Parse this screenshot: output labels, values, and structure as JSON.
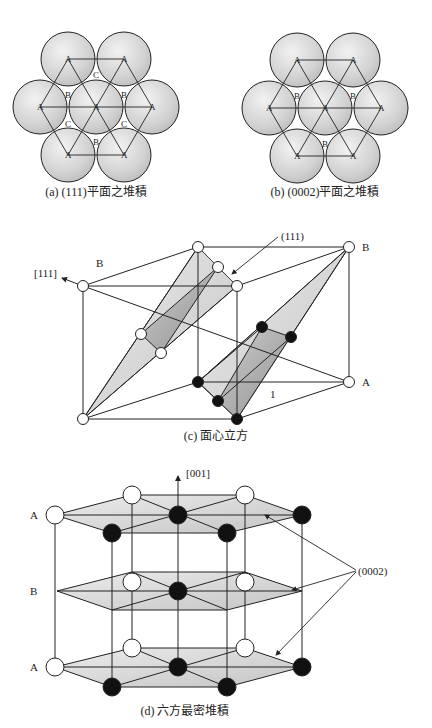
{
  "panels": {
    "a": {
      "caption": "(a) (111)平面之堆積",
      "labels": {
        "A": "A",
        "B": "B",
        "C": "C"
      }
    },
    "b": {
      "caption": "(b) (0002)平面之堆積",
      "labels": {
        "A": "A",
        "B": "B"
      }
    },
    "c": {
      "caption": "(c) 面心立方",
      "direction_label": "[111]",
      "plane_label": "(111)",
      "layer_B_left": "B",
      "layer_B_right": "B",
      "layer_A": "A",
      "edge_label": "1"
    },
    "d": {
      "caption": "(d) 六方最密堆積",
      "direction_label": "[001]",
      "plane_label": "(0002)",
      "layer_top": "A",
      "layer_mid": "B",
      "layer_bottom": "A"
    }
  },
  "colors": {
    "sphere_fill": "#d8d8d8",
    "plane_fill": "#cfcfcf",
    "line": "#222222",
    "atom_dark": "#111111",
    "atom_light": "#ffffff"
  }
}
